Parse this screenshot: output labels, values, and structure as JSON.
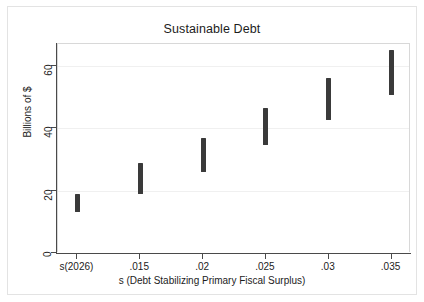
{
  "chart_data": {
    "type": "bar",
    "title": "Sustainable Debt",
    "xlabel": "s (Debt Stabilizing Primary Fiscal Surplus)",
    "ylabel": "Billions of $",
    "categories": [
      "s(2026)",
      ".015",
      ".02",
      ".025",
      ".03",
      ".035"
    ],
    "x_tick_labels": [
      "s(2026)",
      ".015",
      ".02",
      ".025",
      ".03",
      ".035"
    ],
    "y_tick_labels": [
      "0",
      "20",
      "40",
      "60"
    ],
    "y_ticks": [
      0,
      20,
      40,
      60
    ],
    "ylim": [
      0,
      67
    ],
    "grid": true,
    "legend": "none",
    "series": [
      {
        "name": "Sustainable Debt Range",
        "type": "range",
        "low": [
          13.0,
          19.0,
          26.0,
          34.5,
          42.5,
          50.5
        ],
        "high": [
          19.0,
          29.0,
          37.0,
          46.5,
          56.0,
          65.0
        ]
      }
    ],
    "values": [
      16.0,
      24.0,
      31.5,
      40.5,
      49.3,
      57.8
    ],
    "bar_color": "#3a3a3a"
  }
}
